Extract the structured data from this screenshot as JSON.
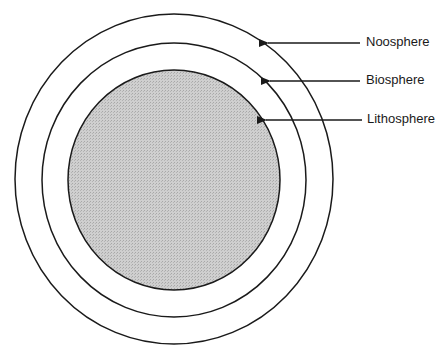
{
  "diagram": {
    "type": "concentric-spheres",
    "layers": [
      {
        "name": "Noosphere",
        "position": "outer",
        "fill": "#ffffff"
      },
      {
        "name": "Biosphere",
        "position": "middle",
        "fill": "#ffffff"
      },
      {
        "name": "Lithosphere",
        "position": "inner",
        "fill": "#c8c8c8"
      }
    ]
  },
  "labels": {
    "outer": "Noosphere",
    "middle": "Biosphere",
    "inner": "Lithosphere"
  },
  "colors": {
    "stroke": "#1a1a1a",
    "core_fill": "#c8c8c8",
    "background": "#ffffff"
  }
}
